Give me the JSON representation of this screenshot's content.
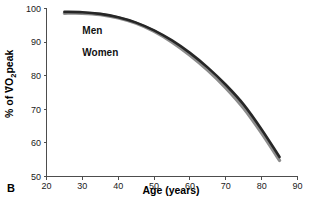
{
  "panel": {
    "label": "B"
  },
  "chart_data": {
    "type": "line",
    "title": "",
    "subtitle": "",
    "xlabel": "Age (years)",
    "ylabel": "% of VO2peak",
    "ylabel_prefix": "% of V",
    "ylabel_o": "O",
    "ylabel_sub": "2",
    "ylabel_suffix": "peak",
    "xlim": [
      20,
      90
    ],
    "ylim": [
      50,
      100
    ],
    "xticks": [
      20,
      30,
      40,
      50,
      60,
      70,
      80,
      90
    ],
    "yticks": [
      50,
      60,
      70,
      80,
      90,
      100
    ],
    "grid": false,
    "legend_position": "inside-upper-left",
    "series": [
      {
        "name": "Men",
        "color": "#262626",
        "x": [
          25,
          30,
          35,
          40,
          45,
          50,
          55,
          60,
          65,
          70,
          75,
          80,
          85
        ],
        "values": [
          99.0,
          98.9,
          98.4,
          97.4,
          95.8,
          93.5,
          90.5,
          86.8,
          82.4,
          77.3,
          71.4,
          64.0,
          55.8
        ]
      },
      {
        "name": "Women",
        "color": "#8c8c8c",
        "x": [
          25,
          30,
          35,
          40,
          45,
          50,
          55,
          60,
          65,
          70,
          75,
          80,
          85
        ],
        "values": [
          98.6,
          98.6,
          98.2,
          97.2,
          95.6,
          93.2,
          90.0,
          86.1,
          81.6,
          76.4,
          70.3,
          62.9,
          54.8
        ]
      }
    ],
    "annotations": [
      {
        "text": "Men",
        "x": 30,
        "y": 92.5
      },
      {
        "text": "Women",
        "x": 30,
        "y": 86.0
      }
    ]
  },
  "colors": {
    "men": "#262626",
    "women": "#8c8c8c",
    "axis": "#4d4d4d",
    "text": "#1a1a1a",
    "background": "#ffffff"
  }
}
